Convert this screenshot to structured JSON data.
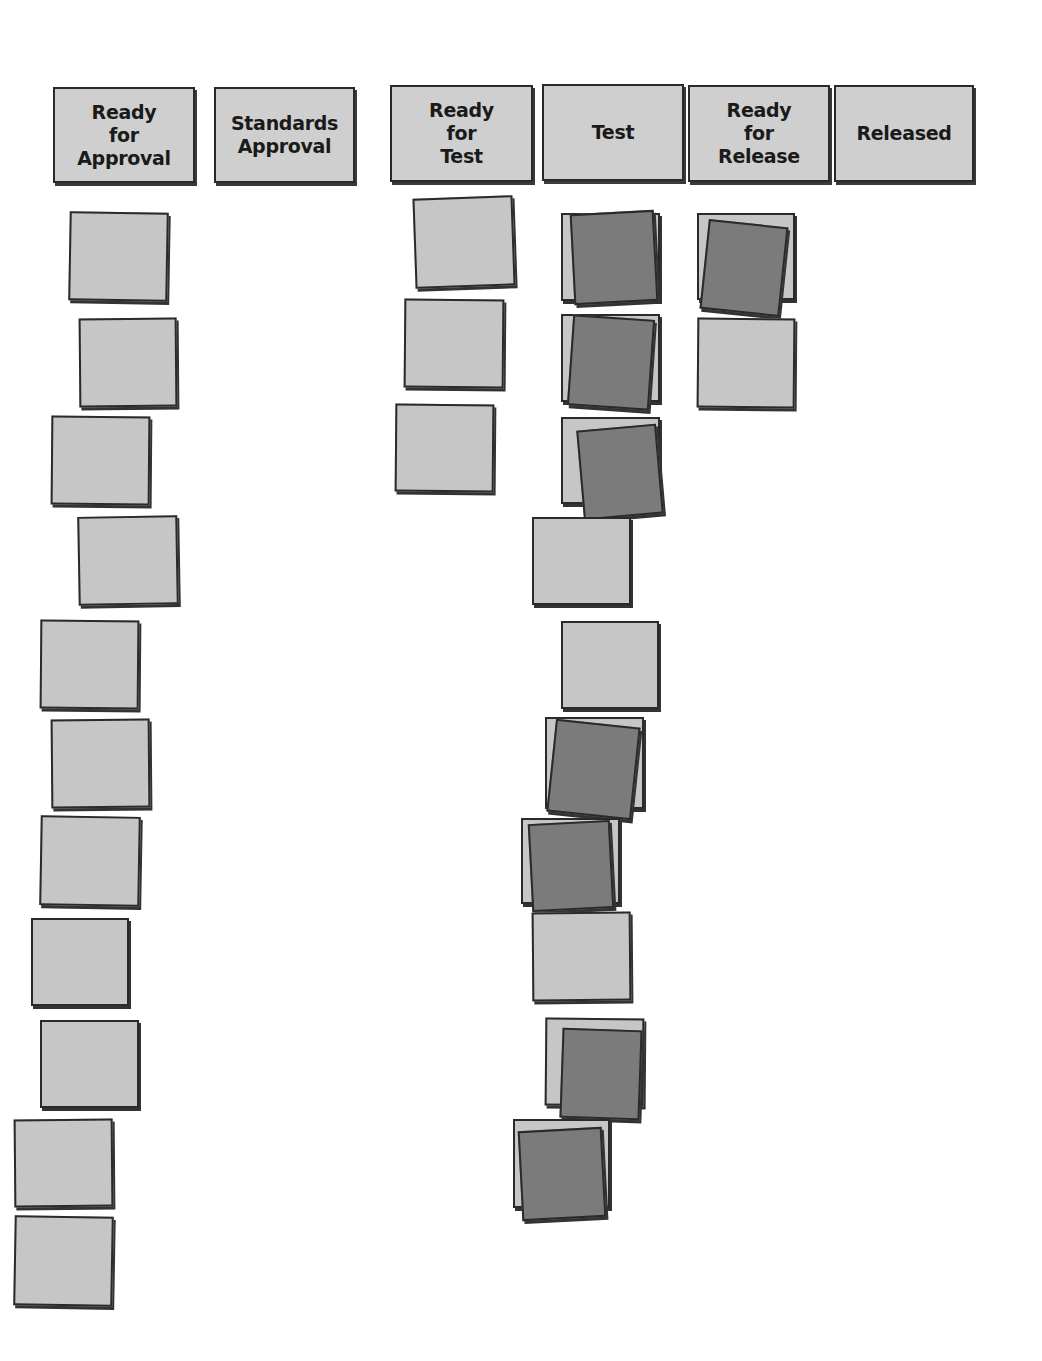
{
  "colors": {
    "header_bg": "#cfcfcf",
    "card_light": "#c6c6c6",
    "card_dark": "#7b7b7b",
    "border": "#2a2a2a"
  },
  "columns": [
    {
      "id": "ready-for-approval",
      "label": "Ready\nfor\nApproval",
      "x": 53,
      "y": 87,
      "w": 142,
      "h": 96
    },
    {
      "id": "standards-approval",
      "label": "Standards\nApproval",
      "x": 214,
      "y": 87,
      "w": 141,
      "h": 96
    },
    {
      "id": "ready-for-test",
      "label": "Ready\nfor\nTest",
      "x": 390,
      "y": 85,
      "w": 143,
      "h": 97
    },
    {
      "id": "test",
      "label": "Test",
      "x": 542,
      "y": 84,
      "w": 142,
      "h": 97
    },
    {
      "id": "ready-for-release",
      "label": "Ready\nfor\nRelease",
      "x": 688,
      "y": 85,
      "w": 142,
      "h": 97
    },
    {
      "id": "released",
      "label": "Released",
      "x": 834,
      "y": 85,
      "w": 140,
      "h": 97
    }
  ],
  "cards": [
    {
      "col": "ready-for-approval",
      "tone": "light",
      "x": 69,
      "y": 212,
      "w": 99,
      "h": 89,
      "r": 1
    },
    {
      "col": "ready-for-approval",
      "tone": "light",
      "x": 79,
      "y": 318,
      "w": 98,
      "h": 89,
      "r": -0.5
    },
    {
      "col": "ready-for-approval",
      "tone": "light",
      "x": 51,
      "y": 416,
      "w": 99,
      "h": 89,
      "r": 0.5
    },
    {
      "col": "ready-for-approval",
      "tone": "light",
      "x": 78,
      "y": 516,
      "w": 100,
      "h": 89,
      "r": -1
    },
    {
      "col": "ready-for-approval",
      "tone": "light",
      "x": 40,
      "y": 620,
      "w": 99,
      "h": 89,
      "r": 0.5
    },
    {
      "col": "ready-for-approval",
      "tone": "light",
      "x": 51,
      "y": 719,
      "w": 99,
      "h": 89,
      "r": -0.5
    },
    {
      "col": "ready-for-approval",
      "tone": "light",
      "x": 40,
      "y": 816,
      "w": 100,
      "h": 90,
      "r": 1
    },
    {
      "col": "ready-for-approval",
      "tone": "light",
      "x": 31,
      "y": 918,
      "w": 98,
      "h": 88,
      "r": 0
    },
    {
      "col": "ready-for-approval",
      "tone": "light",
      "x": 40,
      "y": 1020,
      "w": 99,
      "h": 88,
      "r": 0
    },
    {
      "col": "ready-for-approval",
      "tone": "light",
      "x": 14,
      "y": 1119,
      "w": 99,
      "h": 88,
      "r": -0.5
    },
    {
      "col": "ready-for-approval",
      "tone": "light",
      "x": 14,
      "y": 1216,
      "w": 99,
      "h": 90,
      "r": 1
    },
    {
      "col": "ready-for-test",
      "tone": "light",
      "x": 414,
      "y": 197,
      "w": 100,
      "h": 90,
      "r": -2
    },
    {
      "col": "ready-for-test",
      "tone": "light",
      "x": 404,
      "y": 299,
      "w": 100,
      "h": 89,
      "r": 0.5
    },
    {
      "col": "ready-for-test",
      "tone": "light",
      "x": 395,
      "y": 404,
      "w": 99,
      "h": 88,
      "r": 0.5
    },
    {
      "col": "test",
      "tone": "light",
      "x": 561,
      "y": 213,
      "w": 99,
      "h": 88,
      "r": 0
    },
    {
      "col": "test",
      "tone": "dark",
      "x": 572,
      "y": 212,
      "w": 84,
      "h": 91,
      "r": -3
    },
    {
      "col": "test",
      "tone": "light",
      "x": 561,
      "y": 314,
      "w": 99,
      "h": 88,
      "r": 0
    },
    {
      "col": "test",
      "tone": "dark",
      "x": 570,
      "y": 317,
      "w": 82,
      "h": 91,
      "r": 4
    },
    {
      "col": "test",
      "tone": "light",
      "x": 561,
      "y": 417,
      "w": 99,
      "h": 87,
      "r": 0
    },
    {
      "col": "test",
      "tone": "dark",
      "x": 580,
      "y": 427,
      "w": 80,
      "h": 90,
      "r": -5
    },
    {
      "col": "test",
      "tone": "light",
      "x": 532,
      "y": 517,
      "w": 99,
      "h": 88,
      "r": 0
    },
    {
      "col": "test",
      "tone": "light",
      "x": 561,
      "y": 621,
      "w": 98,
      "h": 88,
      "r": 0
    },
    {
      "col": "test",
      "tone": "light",
      "x": 545,
      "y": 717,
      "w": 99,
      "h": 92,
      "r": 0
    },
    {
      "col": "test",
      "tone": "dark",
      "x": 551,
      "y": 723,
      "w": 85,
      "h": 93,
      "r": 6
    },
    {
      "col": "test",
      "tone": "light",
      "x": 521,
      "y": 818,
      "w": 99,
      "h": 86,
      "r": 0
    },
    {
      "col": "test",
      "tone": "dark",
      "x": 530,
      "y": 822,
      "w": 82,
      "h": 88,
      "r": -3
    },
    {
      "col": "test",
      "tone": "light",
      "x": 532,
      "y": 912,
      "w": 99,
      "h": 89,
      "r": -0.5
    },
    {
      "col": "test",
      "tone": "light",
      "x": 545,
      "y": 1018,
      "w": 99,
      "h": 88,
      "r": 0.5
    },
    {
      "col": "test",
      "tone": "dark",
      "x": 561,
      "y": 1029,
      "w": 80,
      "h": 90,
      "r": 2
    },
    {
      "col": "test",
      "tone": "light",
      "x": 513,
      "y": 1119,
      "w": 97,
      "h": 89,
      "r": 0
    },
    {
      "col": "test",
      "tone": "dark",
      "x": 520,
      "y": 1129,
      "w": 84,
      "h": 90,
      "r": -3
    },
    {
      "col": "ready-for-release",
      "tone": "light",
      "x": 697,
      "y": 213,
      "w": 98,
      "h": 87,
      "r": 0
    },
    {
      "col": "ready-for-release",
      "tone": "dark",
      "x": 704,
      "y": 223,
      "w": 80,
      "h": 90,
      "r": 6
    },
    {
      "col": "ready-for-release",
      "tone": "light",
      "x": 697,
      "y": 318,
      "w": 98,
      "h": 90,
      "r": 0.5
    }
  ]
}
